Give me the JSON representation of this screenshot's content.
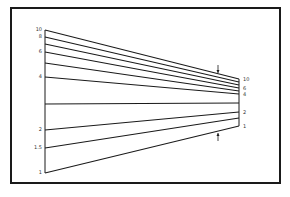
{
  "diagram": {
    "left_axis": {
      "x": 45,
      "top": 30,
      "bottom": 173
    },
    "right_axis": {
      "x": 239,
      "top": 79,
      "bottom": 126
    },
    "lines": [
      {
        "left_y": 30,
        "right_y": 79,
        "left_label": "10",
        "right_label": "10"
      },
      {
        "left_y": 37,
        "right_y": 82,
        "left_label": "8",
        "right_label": ""
      },
      {
        "left_y": 44,
        "right_y": 85,
        "left_label": "",
        "right_label": ""
      },
      {
        "left_y": 52,
        "right_y": 88,
        "left_label": "6",
        "right_label": "6"
      },
      {
        "left_y": 63,
        "right_y": 91,
        "left_label": "",
        "right_label": ""
      },
      {
        "left_y": 77,
        "right_y": 94,
        "left_label": "4",
        "right_label": "4"
      },
      {
        "left_y": 104,
        "right_y": 103,
        "left_label": "",
        "right_label": ""
      },
      {
        "left_y": 130,
        "right_y": 112,
        "left_label": "2",
        "right_label": "2"
      },
      {
        "left_y": 148,
        "right_y": 118,
        "left_label": "1.5",
        "right_label": ""
      },
      {
        "left_y": 173,
        "right_y": 126,
        "left_label": "1",
        "right_label": "1"
      }
    ],
    "arrows": [
      {
        "x": 218,
        "y1": 65,
        "y2": 73,
        "direction": "down"
      },
      {
        "x": 218,
        "y1": 133,
        "y2": 141,
        "direction": "up"
      }
    ],
    "line_color": "#1a1a1a"
  }
}
